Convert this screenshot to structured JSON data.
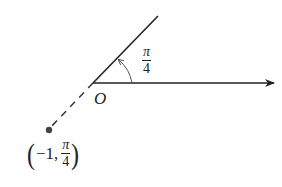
{
  "diagram": {
    "title": "",
    "origin_label": "O",
    "angle_label": {
      "numerator": "π",
      "denominator": "4"
    },
    "point_label": {
      "r": "−1,",
      "theta_numerator": "π",
      "theta_denominator": "4"
    },
    "elements": [
      {
        "type": "polar_axis",
        "description": "horizontal ray from O pointing right with arrowhead"
      },
      {
        "type": "terminal_ray",
        "angle": "π/4",
        "description": "solid ray from O at angle π/4"
      },
      {
        "type": "angle_arc",
        "from": "0",
        "to": "π/4",
        "arrow": true
      },
      {
        "type": "dashed_extension",
        "description": "dashed line from O in opposite direction of π/4 ray"
      },
      {
        "type": "point",
        "coords": "(-1, π/4)",
        "description": "dot on dashed extension"
      }
    ],
    "colors": {
      "line": "#222222",
      "arc": "#555555",
      "point": "#444444"
    }
  }
}
